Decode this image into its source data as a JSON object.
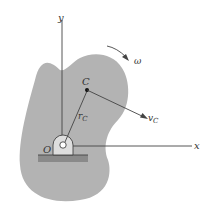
{
  "diagram": {
    "type": "rigid-body-rotation-about-fixed-axis",
    "labels": {
      "y_axis": "y",
      "x_axis": "x",
      "origin": "O",
      "point": "C",
      "position_vector": "r",
      "position_subscript": "C",
      "velocity_vector": "v",
      "velocity_subscript": "C",
      "angular_velocity": "ω"
    },
    "colors": {
      "body_fill": "#b3b3b3",
      "pin_fill": "#dedede",
      "ground": "#8a8a8a",
      "line": "#444444",
      "text": "#333333"
    }
  }
}
